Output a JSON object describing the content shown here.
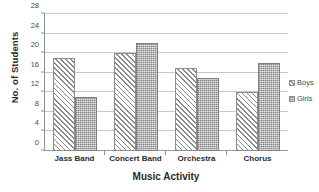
{
  "chart_data": {
    "type": "bar",
    "title": "",
    "xlabel": "Music Activity",
    "ylabel": "No. of Students",
    "categories": [
      "Jass Band",
      "Concert Band",
      "Orchestra",
      "Chorus"
    ],
    "series": [
      {
        "name": "Boys",
        "values": [
          19,
          20,
          17,
          12
        ],
        "pattern": "diagonal-hatch",
        "color": "#8a8a8a"
      },
      {
        "name": "Girls",
        "values": [
          11,
          22,
          15,
          18
        ],
        "pattern": "stipple-checker",
        "color": "#b6b6b6"
      }
    ],
    "ylim": [
      0,
      28
    ],
    "yticks": [
      0,
      4,
      8,
      12,
      16,
      20,
      24,
      28
    ],
    "ytick_labels": [
      "0",
      "4",
      "8",
      "12",
      "16",
      "20",
      "24",
      "28"
    ],
    "grid": true,
    "grid_axis": "y",
    "legend_position": "right"
  },
  "legend": {
    "items": [
      {
        "label": "Boys"
      },
      {
        "label": "Girls"
      }
    ]
  },
  "axes": {
    "y_title": "No. of Students",
    "x_title": "Music Activity"
  },
  "colors": {
    "gridline": "#c8c8c8",
    "axis": "#8f8f8f",
    "boys_hatch": "#8a8a8a",
    "girls_fill": "#b6b6b6",
    "text": "#2b2b2b"
  }
}
